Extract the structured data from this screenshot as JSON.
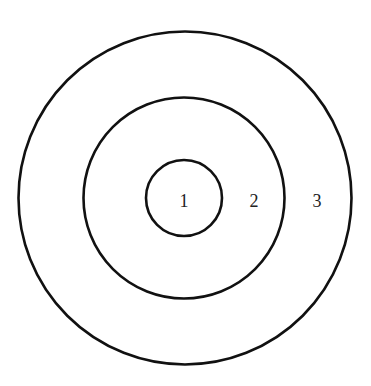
{
  "diagram": {
    "type": "concentric-circles",
    "center": {
      "x": 184.5,
      "y": 198
    },
    "stroke_color": "#111111",
    "background_color": "#ffffff",
    "rings": [
      {
        "id": "inner",
        "radius": 38
      },
      {
        "id": "middle",
        "radius": 100.5
      },
      {
        "id": "outer",
        "radius": 166.5
      }
    ],
    "labels": [
      {
        "text": "1",
        "x": 184,
        "y": 207
      },
      {
        "text": "2",
        "x": 254,
        "y": 207
      },
      {
        "text": "3",
        "x": 317,
        "y": 207
      }
    ]
  }
}
